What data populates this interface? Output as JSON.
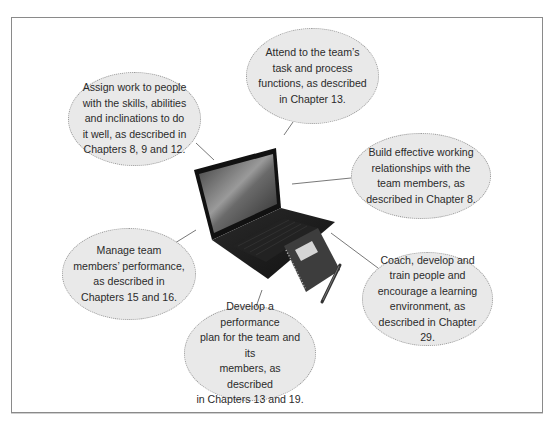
{
  "diagram": {
    "center_image": "laptop-with-notebook-and-pen",
    "colors": {
      "frame_border": "#8a8a8a",
      "bubble_fill": "#e9e9e9",
      "bubble_border": "#9a9a9a",
      "text": "#2b2b2b",
      "connector": "#555555"
    },
    "bubbles": [
      {
        "id": "assign-work",
        "lines": [
          "Assign work to people",
          "with the skills, abilities",
          "and inclinations to do",
          "it well, as described in",
          "Chapters 8, 9 and 12."
        ]
      },
      {
        "id": "attend-task",
        "lines": [
          "Attend to the team’s",
          "task and process",
          "functions, as described",
          "in Chapter 13."
        ]
      },
      {
        "id": "build-relationships",
        "lines": [
          "Build effective working",
          "relationships with the",
          "team members, as",
          "described in Chapter 8."
        ]
      },
      {
        "id": "manage-performance",
        "lines": [
          "Manage team",
          "members’ performance,",
          "as described in",
          "Chapters 15 and 16."
        ]
      },
      {
        "id": "develop-plan",
        "lines": [
          "Develop a performance",
          "plan for the team and its",
          "members, as described",
          "in Chapters 13 and 19."
        ]
      },
      {
        "id": "coach-develop",
        "lines": [
          "Coach, develop and",
          "train people and",
          "encourage a learning",
          "environment, as",
          "described in Chapter 29."
        ]
      }
    ]
  }
}
